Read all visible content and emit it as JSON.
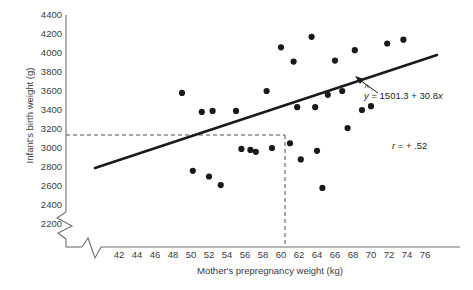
{
  "chart_data": {
    "type": "scatter",
    "title": "",
    "xlabel": "Mother's prepregnancy weight (kg)",
    "ylabel": "Infant's birth weight (g)",
    "xlim": [
      41,
      77
    ],
    "ylim": [
      2100,
      4500
    ],
    "x_ticks": [
      42,
      44,
      46,
      48,
      50,
      52,
      54,
      56,
      58,
      60,
      62,
      64,
      66,
      68,
      70,
      72,
      74,
      76
    ],
    "y_ticks": [
      2200,
      2400,
      2600,
      2800,
      3000,
      3200,
      3400,
      3600,
      3800,
      4000,
      4200,
      4400
    ],
    "grid": false,
    "axis_break_x": true,
    "axis_break_y": true,
    "points": [
      {
        "x": 49.0,
        "y": 3580
      },
      {
        "x": 50.2,
        "y": 2760
      },
      {
        "x": 51.2,
        "y": 3380
      },
      {
        "x": 52.4,
        "y": 3390
      },
      {
        "x": 52.0,
        "y": 2700
      },
      {
        "x": 53.3,
        "y": 2610
      },
      {
        "x": 55.0,
        "y": 3390
      },
      {
        "x": 55.6,
        "y": 2990
      },
      {
        "x": 56.6,
        "y": 2980
      },
      {
        "x": 57.2,
        "y": 2960
      },
      {
        "x": 58.4,
        "y": 3600
      },
      {
        "x": 59.0,
        "y": 3000
      },
      {
        "x": 60.0,
        "y": 4060
      },
      {
        "x": 61.0,
        "y": 3050
      },
      {
        "x": 61.4,
        "y": 3910
      },
      {
        "x": 61.8,
        "y": 3430
      },
      {
        "x": 62.2,
        "y": 2880
      },
      {
        "x": 63.4,
        "y": 4170
      },
      {
        "x": 63.8,
        "y": 3430
      },
      {
        "x": 64.0,
        "y": 2970
      },
      {
        "x": 64.6,
        "y": 2580
      },
      {
        "x": 65.2,
        "y": 3560
      },
      {
        "x": 66.0,
        "y": 3920
      },
      {
        "x": 66.8,
        "y": 3600
      },
      {
        "x": 67.4,
        "y": 3210
      },
      {
        "x": 68.2,
        "y": 4030
      },
      {
        "x": 69.0,
        "y": 3400
      },
      {
        "x": 70.0,
        "y": 3440
      },
      {
        "x": 71.8,
        "y": 4100
      },
      {
        "x": 73.6,
        "y": 4140
      }
    ],
    "regression": {
      "equation_label": "= 1501.3 + 30.8",
      "intercept": 1501.3,
      "slope": 30.8,
      "x_start": 43.6,
      "x_end": 77.0
    },
    "correlation": {
      "label": "= + .52",
      "value": 0.52
    },
    "reference_lines": {
      "x_value": 61,
      "y_value": 3050,
      "style": "dashed"
    },
    "symbols": {
      "y_hat": "y",
      "r_symbol": "r",
      "hat_mark": "^"
    },
    "colors": {
      "axis": "#6d6e71",
      "point": "#1a1a1a",
      "regression_line": "#1a1a1a",
      "dashed_line": "#4d4d4d",
      "text": "#3b3b3b"
    }
  }
}
